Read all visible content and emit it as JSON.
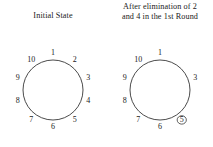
{
  "figure": {
    "background_color": "#ffffff",
    "stroke_color": "#2b2b2b",
    "text_color": "#1a1a1a"
  },
  "panels": [
    {
      "id": "initial-state",
      "caption_lines": [
        "Initial State"
      ],
      "caption": "Initial State",
      "circle": {
        "center_x": 53,
        "center_y": 90,
        "radius": 30,
        "label_radius": 37
      },
      "nodes": [
        {
          "label": "1",
          "angle_deg": -90,
          "removed": false,
          "marked": false
        },
        {
          "label": "2",
          "angle_deg": -54,
          "removed": false,
          "marked": false
        },
        {
          "label": "3",
          "angle_deg": -18,
          "removed": false,
          "marked": false
        },
        {
          "label": "4",
          "angle_deg": 18,
          "removed": false,
          "marked": false
        },
        {
          "label": "5",
          "angle_deg": 54,
          "removed": false,
          "marked": false
        },
        {
          "label": "6",
          "angle_deg": 90,
          "removed": false,
          "marked": false
        },
        {
          "label": "7",
          "angle_deg": 126,
          "removed": false,
          "marked": false
        },
        {
          "label": "8",
          "angle_deg": 162,
          "removed": false,
          "marked": false
        },
        {
          "label": "9",
          "angle_deg": 198,
          "removed": false,
          "marked": false
        },
        {
          "label": "10",
          "angle_deg": 234,
          "removed": false,
          "marked": false
        }
      ]
    },
    {
      "id": "after-first-round",
      "caption_lines": [
        "After elimination of 2",
        "and 4 in the 1st Round"
      ],
      "caption": "After elimination of 2 and 4 in the 1st Round",
      "circle": {
        "center_x": 53,
        "center_y": 90,
        "radius": 30,
        "label_radius": 37
      },
      "nodes": [
        {
          "label": "1",
          "angle_deg": -90,
          "removed": false,
          "marked": false
        },
        {
          "label": "2",
          "angle_deg": -54,
          "removed": true,
          "marked": false
        },
        {
          "label": "3",
          "angle_deg": -18,
          "removed": false,
          "marked": false
        },
        {
          "label": "4",
          "angle_deg": 18,
          "removed": true,
          "marked": false
        },
        {
          "label": "5",
          "angle_deg": 54,
          "removed": false,
          "marked": true
        },
        {
          "label": "6",
          "angle_deg": 90,
          "removed": false,
          "marked": false
        },
        {
          "label": "7",
          "angle_deg": 126,
          "removed": false,
          "marked": false
        },
        {
          "label": "8",
          "angle_deg": 162,
          "removed": false,
          "marked": false
        },
        {
          "label": "9",
          "angle_deg": 198,
          "removed": false,
          "marked": false
        },
        {
          "label": "10",
          "angle_deg": 234,
          "removed": false,
          "marked": false
        }
      ]
    }
  ],
  "chart_data": {
    "type": "diagram",
    "title": "",
    "panels": [
      {
        "caption": "Initial State",
        "present": [
          "1",
          "2",
          "3",
          "4",
          "5",
          "6",
          "7",
          "8",
          "9",
          "10"
        ],
        "removed": [],
        "highlighted": []
      },
      {
        "caption": "After elimination of 2 and 4 in the 1st Round",
        "present": [
          "1",
          "3",
          "5",
          "6",
          "7",
          "8",
          "9",
          "10"
        ],
        "removed": [
          "2",
          "4"
        ],
        "highlighted": [
          "5"
        ]
      }
    ]
  }
}
